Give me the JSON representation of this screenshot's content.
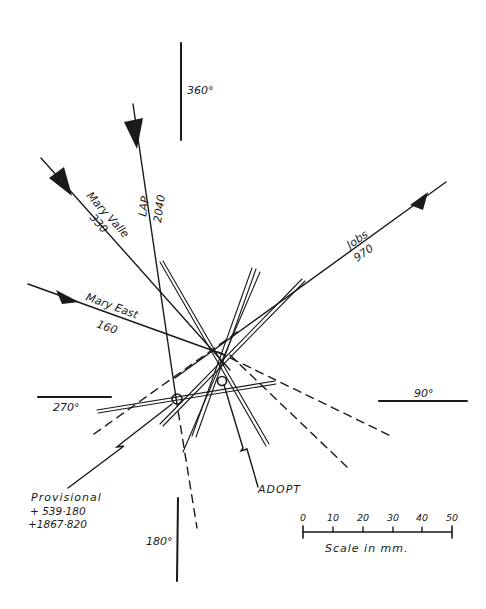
{
  "diagram": {
    "type": "position-line plot (radio direction-finding bearings)",
    "compass_labels": {
      "north": "360°",
      "east": "90°",
      "south": "180°",
      "west": "270°"
    },
    "stations": [
      {
        "name": "LAP",
        "value": "2040"
      },
      {
        "name": "Mary Valle",
        "value": "330"
      },
      {
        "name": "Mary East",
        "value": "160"
      },
      {
        "name": "Jobs",
        "value": "970"
      }
    ],
    "annotations": {
      "provisional_label": "Provisional",
      "provisional_coord_1": "+ 539·180",
      "provisional_coord_2": "+1867·820",
      "adopt_label": "ADOPT"
    },
    "scale": {
      "ticks": [
        "0",
        "10",
        "20",
        "30",
        "40",
        "50"
      ],
      "caption": "Scale in mm."
    },
    "colors": {
      "ink": "#1a1a1a",
      "background": "#ffffff"
    }
  }
}
